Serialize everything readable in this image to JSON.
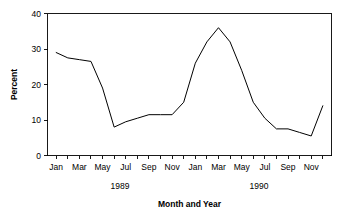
{
  "chart_data": {
    "type": "line",
    "title": "",
    "xlabel": "Month and Year",
    "ylabel": "Percent",
    "ylim": [
      0,
      40
    ],
    "yticks": [
      0,
      10,
      20,
      30,
      40
    ],
    "ytick_labels": [
      "0",
      "10",
      "20",
      "30",
      "40"
    ],
    "grid": false,
    "legend": "none",
    "x": [
      "Jan 1989",
      "Feb 1989",
      "Mar 1989",
      "Apr 1989",
      "May 1989",
      "Jun 1989",
      "Jul 1989",
      "Aug 1989",
      "Sep 1989",
      "Oct 1989",
      "Nov 1989",
      "Dec 1989",
      "Jan 1990",
      "Feb 1990",
      "Mar 1990",
      "Apr 1990",
      "May 1990",
      "Jun 1990",
      "Jul 1990",
      "Aug 1990",
      "Sep 1990",
      "Oct 1990",
      "Nov 1990",
      "Dec 1990"
    ],
    "categories": [
      "Jan",
      "Feb",
      "Mar",
      "Apr",
      "May",
      "Jun",
      "Jul",
      "Aug",
      "Sep",
      "Oct",
      "Nov",
      "Dec",
      "Jan",
      "Feb",
      "Mar",
      "Apr",
      "May",
      "Jun",
      "Jul",
      "Aug",
      "Sep",
      "Oct",
      "Nov",
      "Dec"
    ],
    "values": [
      29.0,
      27.5,
      27.0,
      26.5,
      19.0,
      8.0,
      9.5,
      10.5,
      11.5,
      11.5,
      11.5,
      15.0,
      26.0,
      32.0,
      36.0,
      32.0,
      24.0,
      15.0,
      10.5,
      7.5,
      7.5,
      6.5,
      5.5,
      14.0
    ],
    "xtick_labels_visible": [
      "Jan",
      "Mar",
      "May",
      "Jul",
      "Sep",
      "Nov",
      "Jan",
      "Mar",
      "May",
      "Jul",
      "Sep",
      "Nov"
    ],
    "xtick_label_indices": [
      0,
      2,
      4,
      6,
      8,
      10,
      12,
      14,
      16,
      18,
      20,
      22
    ],
    "group_labels": [
      "1989",
      "1990"
    ],
    "group_label_indices": [
      5,
      17
    ],
    "line_color": "#000000",
    "axis_color": "#000000",
    "background_color": "#ffffff"
  }
}
